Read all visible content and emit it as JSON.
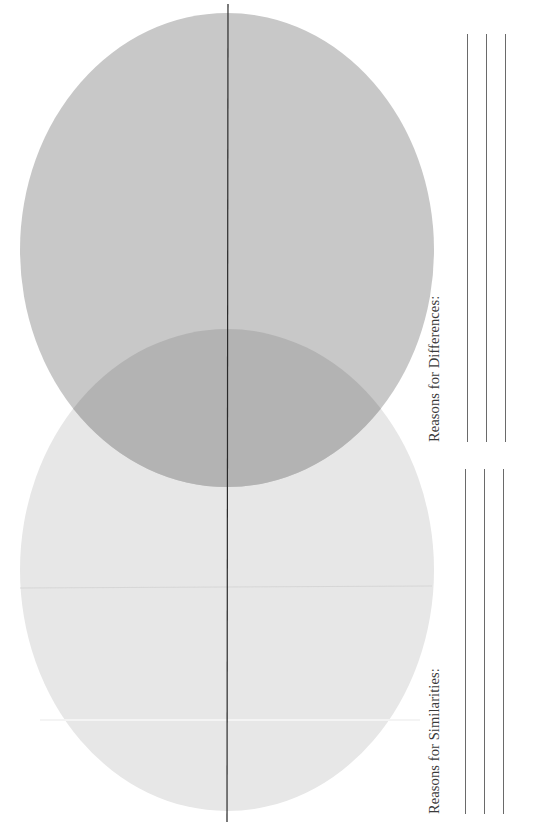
{
  "worksheet": {
    "type": "Venn diagram worksheet (rotated 90°)",
    "venn": {
      "circle_top": {
        "fill": "#c8c8c8",
        "cx": 227,
        "cy": 250,
        "rx": 207,
        "ry": 237
      },
      "circle_bottom": {
        "fill": "#e7e7e7",
        "cx": 227,
        "cy": 570,
        "rx": 207,
        "ry": 241
      },
      "overlap_fill": "#b3b3b3",
      "divider_line": {
        "x": 228,
        "y1": 4,
        "y2": 822,
        "color": "#2a2a2a"
      }
    },
    "sections": [
      {
        "label": "Reasons for Differences:",
        "line_count": 3,
        "line_x": [
          467,
          486,
          505
        ],
        "line_y": [
          34,
          442
        ]
      },
      {
        "label": "Reasons for Similarities:",
        "line_count": 3,
        "line_x": [
          465,
          484,
          503
        ],
        "line_y": [
          469,
          814
        ]
      }
    ]
  }
}
